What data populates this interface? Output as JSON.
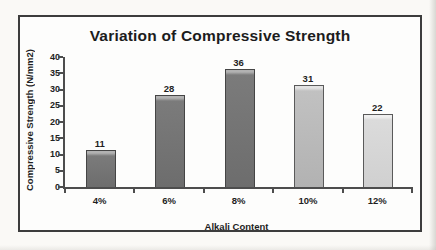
{
  "chart_data": {
    "type": "bar",
    "title": "Variation of Compressive Strength",
    "xlabel": "Alkali Content",
    "ylabel": "Compressive Strength (N/mm2)",
    "categories": [
      "4%",
      "6%",
      "8%",
      "10%",
      "12%"
    ],
    "values": [
      11,
      28,
      36,
      31,
      22
    ],
    "data_labels": [
      "11",
      "28",
      "36",
      "31",
      "22"
    ],
    "ylim": [
      0,
      40
    ],
    "yticks": [
      0,
      5,
      10,
      15,
      20,
      25,
      30,
      35,
      40
    ],
    "grid": false,
    "legend": "none",
    "axis_color": "#4d4d4d",
    "text_color": "#1f1f1f",
    "frame_border_color": "#3c3c3c",
    "bar_colors": [
      {
        "fill": "#7b7b7b",
        "shade": "#6d6d6d",
        "highlight": "#b2b2b2",
        "border": "#454545"
      },
      {
        "fill": "#7b7b7b",
        "shade": "#6d6d6d",
        "highlight": "#b2b2b2",
        "border": "#454545"
      },
      {
        "fill": "#7b7b7b",
        "shade": "#6d6d6d",
        "highlight": "#b2b2b2",
        "border": "#454545"
      },
      {
        "fill": "#c1c1c1",
        "shade": "#b2b2b2",
        "highlight": "#e3e3e3",
        "border": "#5a5a5a"
      },
      {
        "fill": "#dbdbdb",
        "shade": "#d0d0d0",
        "highlight": "#efefef",
        "border": "#5a5a5a"
      }
    ]
  }
}
